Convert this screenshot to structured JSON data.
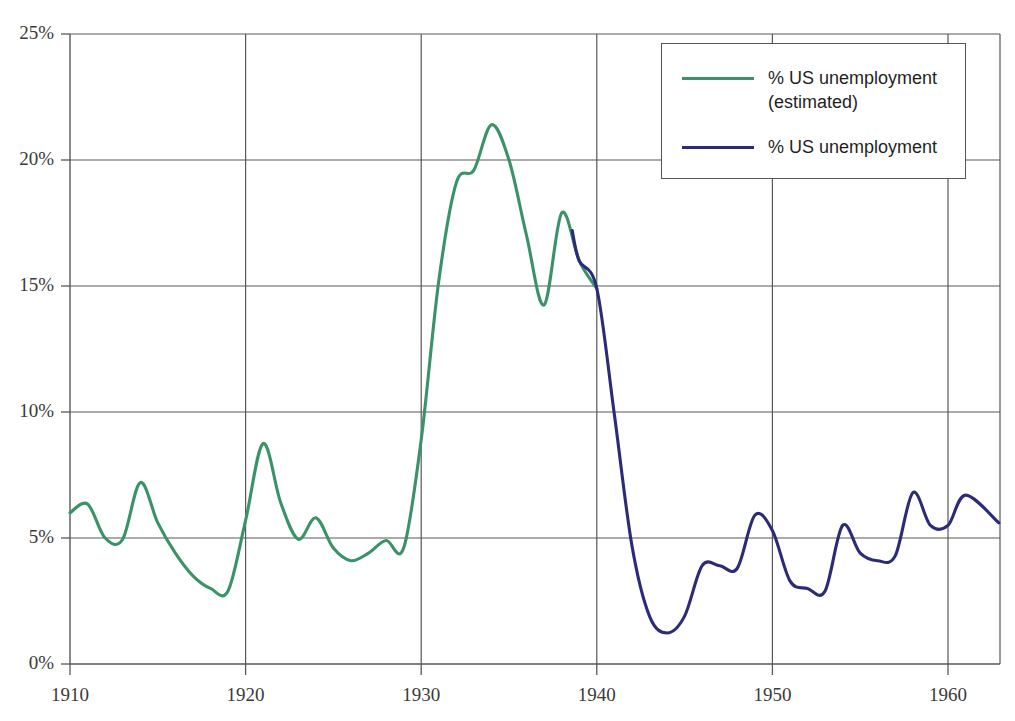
{
  "chart_data": {
    "type": "line",
    "title": "",
    "subtitle": "",
    "xlabel": "",
    "ylabel": "",
    "xlim": [
      1909.5,
      1962.9
    ],
    "ylim": [
      0,
      25
    ],
    "grid": true,
    "y_tick_labels": [
      "0%",
      "5%",
      "10%",
      "15%",
      "20%",
      "25%"
    ],
    "y_ticks": [
      0,
      5,
      10,
      15,
      20,
      25
    ],
    "x_tick_labels": [
      "1910",
      "1920",
      "1930",
      "1940",
      "1950",
      "1960"
    ],
    "x_ticks": [
      1910,
      1920,
      1930,
      1940,
      1950,
      1960
    ],
    "legend_position": "top-right",
    "series": [
      {
        "name": "% US unemployment (estimated)",
        "color": "#3a9268",
        "x": [
          1910,
          1911,
          1912,
          1913,
          1914,
          1915,
          1916,
          1917,
          1918,
          1919,
          1920,
          1921,
          1922,
          1923,
          1924,
          1925,
          1926,
          1927,
          1928,
          1929,
          1930,
          1931,
          1932,
          1933,
          1934,
          1935,
          1936,
          1937,
          1938,
          1939,
          1940
        ],
        "values": [
          6.0,
          6.35,
          5.0,
          4.95,
          7.2,
          5.6,
          4.4,
          3.5,
          3.0,
          2.9,
          5.7,
          8.75,
          6.4,
          4.95,
          5.8,
          4.6,
          4.1,
          4.4,
          4.9,
          4.6,
          8.9,
          15.2,
          19.1,
          19.6,
          21.4,
          20.0,
          17.0,
          14.25,
          17.9,
          16.0,
          14.9
        ]
      },
      {
        "name": "% US unemployment",
        "color": "#2b2b7a",
        "x": [
          1938.6,
          1939,
          1940,
          1941,
          1942,
          1943,
          1944,
          1945,
          1946,
          1947,
          1948,
          1949,
          1950,
          1951,
          1952,
          1953,
          1954,
          1955,
          1956,
          1957,
          1958,
          1959,
          1960,
          1961,
          1962.9
        ],
        "values": [
          17.2,
          16.0,
          14.9,
          9.9,
          4.7,
          1.9,
          1.23,
          1.9,
          3.9,
          3.9,
          3.8,
          5.9,
          5.3,
          3.3,
          3.0,
          2.9,
          5.5,
          4.4,
          4.1,
          4.3,
          6.8,
          5.5,
          5.5,
          6.7,
          5.6
        ]
      }
    ]
  },
  "legend": {
    "entries": [
      {
        "label": "% US unemployment\n(estimated)",
        "color": "#3a9268"
      },
      {
        "label": "% US unemployment",
        "color": "#2b2b7a"
      }
    ]
  }
}
